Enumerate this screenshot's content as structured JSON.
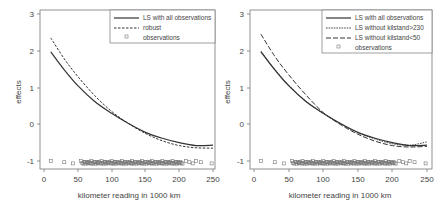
{
  "chart_data": [
    {
      "type": "line",
      "title": "",
      "xlabel": "kilometer reading in 1000 km",
      "ylabel": "effects",
      "xlim": [
        0,
        250
      ],
      "ylim": [
        -1.2,
        3
      ],
      "xticks": [
        0,
        50,
        100,
        150,
        200,
        250
      ],
      "yticks": [
        -1,
        0,
        1,
        2,
        3
      ],
      "grid": false,
      "legend_position": "top-right",
      "legend": [
        "LS with all observations",
        "robust",
        "observations"
      ],
      "series": [
        {
          "name": "LS with all observations",
          "style": "solid",
          "x": [
            10,
            30,
            50,
            75,
            100,
            125,
            150,
            175,
            200,
            225,
            250
          ],
          "y": [
            1.97,
            1.48,
            1.05,
            0.62,
            0.3,
            0.02,
            -0.22,
            -0.38,
            -0.5,
            -0.58,
            -0.57
          ]
        },
        {
          "name": "robust",
          "style": "dashed",
          "x": [
            10,
            30,
            50,
            75,
            100,
            125,
            150,
            175,
            200,
            225,
            250
          ],
          "y": [
            2.35,
            1.78,
            1.3,
            0.78,
            0.35,
            0.02,
            -0.25,
            -0.45,
            -0.58,
            -0.64,
            -0.65
          ]
        },
        {
          "name": "observations",
          "style": "points",
          "x": [
            10,
            30,
            43,
            55,
            60,
            65,
            70,
            75,
            80,
            85,
            90,
            95,
            100,
            105,
            110,
            115,
            120,
            125,
            130,
            135,
            140,
            145,
            150,
            155,
            160,
            165,
            170,
            175,
            180,
            185,
            190,
            195,
            200,
            210,
            215,
            220,
            225,
            232,
            248
          ],
          "y": [
            -1,
            -1,
            -1,
            -1,
            -1,
            -1,
            -1,
            -1,
            -1,
            -1,
            -1,
            -1,
            -1,
            -1,
            -1,
            -1,
            -1,
            -1,
            -1,
            -1,
            -1,
            -1,
            -1,
            -1,
            -1,
            -1,
            -1,
            -1,
            -1,
            -1,
            -1,
            -1,
            -1,
            -1,
            -1,
            -1,
            -1,
            -1,
            -1
          ]
        }
      ]
    },
    {
      "type": "line",
      "title": "",
      "xlabel": "kilometer reading in 1000 km",
      "ylabel": "effects",
      "xlim": [
        0,
        250
      ],
      "ylim": [
        -1.2,
        3
      ],
      "xticks": [
        0,
        50,
        100,
        150,
        200,
        250
      ],
      "yticks": [
        -1,
        0,
        1,
        2,
        3
      ],
      "grid": false,
      "legend_position": "top-right",
      "legend": [
        "LS with all observations",
        "LS without kilstand>230",
        "LS without kilstand<50",
        "observations"
      ],
      "series": [
        {
          "name": "LS with all observations",
          "style": "solid",
          "x": [
            10,
            30,
            50,
            75,
            100,
            125,
            150,
            175,
            200,
            225,
            250
          ],
          "y": [
            1.97,
            1.48,
            1.05,
            0.62,
            0.3,
            0.02,
            -0.22,
            -0.38,
            -0.5,
            -0.58,
            -0.57
          ]
        },
        {
          "name": "LS without kilstand>230",
          "style": "dotted",
          "x": [
            10,
            30,
            50,
            75,
            100,
            125,
            150,
            175,
            200,
            225,
            250
          ],
          "y": [
            1.99,
            1.5,
            1.07,
            0.63,
            0.3,
            0.01,
            -0.23,
            -0.4,
            -0.53,
            -0.57,
            -0.48
          ]
        },
        {
          "name": "LS without kilstand<50",
          "style": "long-dashed",
          "x": [
            10,
            30,
            50,
            75,
            100,
            125,
            150,
            175,
            200,
            225,
            250
          ],
          "y": [
            2.45,
            1.85,
            1.35,
            0.8,
            0.32,
            -0.01,
            -0.27,
            -0.46,
            -0.58,
            -0.62,
            -0.6
          ]
        },
        {
          "name": "observations",
          "style": "points",
          "x": [
            10,
            30,
            43,
            55,
            60,
            65,
            70,
            75,
            80,
            85,
            90,
            95,
            100,
            105,
            110,
            115,
            120,
            125,
            130,
            135,
            140,
            145,
            150,
            155,
            160,
            165,
            170,
            175,
            180,
            185,
            190,
            195,
            200,
            210,
            215,
            220,
            225,
            232,
            248
          ],
          "y": [
            -1,
            -1,
            -1,
            -1,
            -1,
            -1,
            -1,
            -1,
            -1,
            -1,
            -1,
            -1,
            -1,
            -1,
            -1,
            -1,
            -1,
            -1,
            -1,
            -1,
            -1,
            -1,
            -1,
            -1,
            -1,
            -1,
            -1,
            -1,
            -1,
            -1,
            -1,
            -1,
            -1,
            -1,
            -1,
            -1,
            -1,
            -1,
            -1
          ]
        }
      ]
    }
  ],
  "panels": [
    {
      "ylabel": "effects",
      "xlabel": "kilometer reading in 1000 km",
      "legend": [
        "LS with all observations",
        "robust",
        "observations"
      ]
    },
    {
      "ylabel": "effects",
      "xlabel": "kilometer reading in 1000 km",
      "legend": [
        "LS with all observations",
        "LS without kilstand>230",
        "LS without kilstand<50",
        "observations"
      ]
    }
  ],
  "ticks": {
    "x": [
      "0",
      "50",
      "100",
      "150",
      "200",
      "250"
    ],
    "y": [
      "-1",
      "0",
      "1",
      "2",
      "3"
    ]
  }
}
